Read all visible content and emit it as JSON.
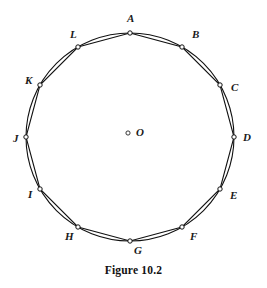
{
  "figure": {
    "caption": "Figure 10.2",
    "geometry": {
      "type": "inscribed-regular-dodecagon",
      "circle": {
        "cx": 130,
        "cy": 137,
        "r": 104
      },
      "sides": 12,
      "start_angle_deg": -90,
      "stroke_color": "#111111",
      "background_color": "#ffffff"
    },
    "center": {
      "label": "O",
      "marker_x": 128,
      "marker_y": 133,
      "label_x": 136,
      "label_y": 136
    },
    "vertices": [
      {
        "label": "A",
        "px": 130,
        "py": 33,
        "label_x": 127,
        "label_y": 22
      },
      {
        "label": "B",
        "px": 182,
        "py": 47,
        "label_x": 192,
        "label_y": 38
      },
      {
        "label": "C",
        "px": 220,
        "py": 85,
        "label_x": 231,
        "label_y": 91
      },
      {
        "label": "D",
        "px": 234,
        "py": 137,
        "label_x": 243,
        "label_y": 141
      },
      {
        "label": "E",
        "px": 220,
        "py": 189,
        "label_x": 230,
        "label_y": 199
      },
      {
        "label": "F",
        "px": 182,
        "py": 227,
        "label_x": 190,
        "label_y": 240
      },
      {
        "label": "G",
        "px": 130,
        "py": 241,
        "label_x": 134,
        "label_y": 254
      },
      {
        "label": "H",
        "px": 78,
        "py": 227,
        "label_x": 65,
        "label_y": 240
      },
      {
        "label": "I",
        "px": 40,
        "py": 189,
        "label_x": 28,
        "label_y": 198
      },
      {
        "label": "J",
        "px": 26,
        "py": 137,
        "label_x": 13,
        "label_y": 142
      },
      {
        "label": "K",
        "px": 40,
        "py": 85,
        "label_x": 25,
        "label_y": 84
      },
      {
        "label": "L",
        "px": 78,
        "py": 47,
        "label_x": 70,
        "label_y": 38
      }
    ]
  }
}
